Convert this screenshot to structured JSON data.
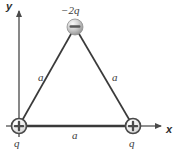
{
  "figure": {
    "axes": {
      "x_label": "x",
      "y_label": "y"
    },
    "colors": {
      "line": "#3a3a3a",
      "axis": "#555555",
      "text": "#3c3c3c",
      "sphere_light": "#f2f2f2",
      "sphere_mid": "#b9b9b9",
      "sphere_dark": "#8a8a8a",
      "background": "#ffffff"
    },
    "charges": [
      {
        "id": "top",
        "label": "−2q",
        "sign": "negative",
        "glyph": "minus-sphere",
        "cx": 75,
        "cy": 27
      },
      {
        "id": "bottom-left",
        "label": "q",
        "sign": "positive",
        "glyph": "plus-circle",
        "cx": 19,
        "cy": 126
      },
      {
        "id": "bottom-right",
        "label": "q",
        "sign": "positive",
        "glyph": "plus-circle",
        "cx": 133,
        "cy": 126
      }
    ],
    "sides": [
      {
        "id": "left",
        "label": "a"
      },
      {
        "id": "right",
        "label": "a"
      },
      {
        "id": "base",
        "label": "a"
      }
    ]
  }
}
